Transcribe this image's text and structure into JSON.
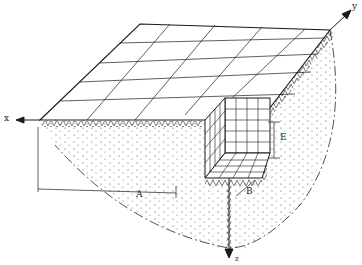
{
  "diagram": {
    "axes": {
      "x": {
        "label": "x",
        "direction": "left"
      },
      "y": {
        "label": "y",
        "direction": "up-right"
      },
      "z": {
        "label": "z",
        "direction": "down"
      }
    },
    "dimensions": {
      "A": "A",
      "B": "B",
      "E": "E"
    },
    "colors": {
      "line": "#1a1a1a",
      "background": "#ffffff",
      "soil_dots": "#444444"
    }
  }
}
